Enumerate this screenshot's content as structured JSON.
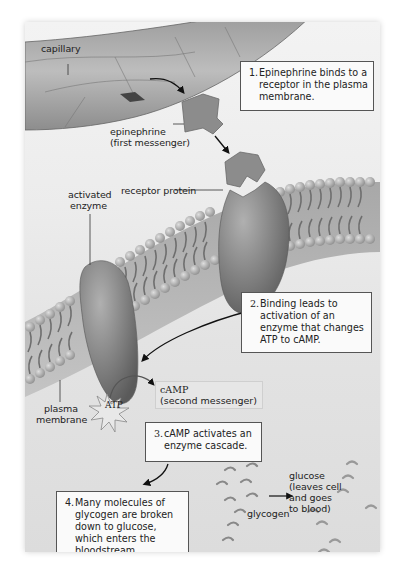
{
  "figure": {
    "labels": {
      "capillary": "capillary",
      "epinephrine": "epinephrine",
      "epinephrine_sub": "(first messenger)",
      "activated_enzyme_1": "activated",
      "activated_enzyme_2": "enzyme",
      "receptor_protein": "receptor protein",
      "plasma_membrane_1": "plasma",
      "plasma_membrane_2": "membrane",
      "atp": "ATP",
      "camp": "cAMP",
      "camp_sub": "(second messenger)",
      "glycogen": "glycogen",
      "glucose_1": "glucose",
      "glucose_2": "(leaves cell",
      "glucose_3": "and goes",
      "glucose_4": "to blood)"
    },
    "steps": [
      {
        "number": "1.",
        "text": "Epinephrine binds to a\nreceptor in the plasma\nmembrane."
      },
      {
        "number": "2.",
        "text": "Binding leads to\nactivation of an\nenzyme that changes\nATP to cAMP."
      },
      {
        "number": "3.",
        "text": "cAMP activates an\nenzyme cascade."
      },
      {
        "number": "4.",
        "text": "Many molecules of\nglycogen are broken\ndown to glucose,\nwhich enters the\nbloodstream."
      }
    ],
    "colors": {
      "background": "#e8e8e8",
      "protein": "#8a8a8a",
      "membrane_head": "#b5b5b5",
      "text": "#222222",
      "box_border": "#555555"
    }
  }
}
